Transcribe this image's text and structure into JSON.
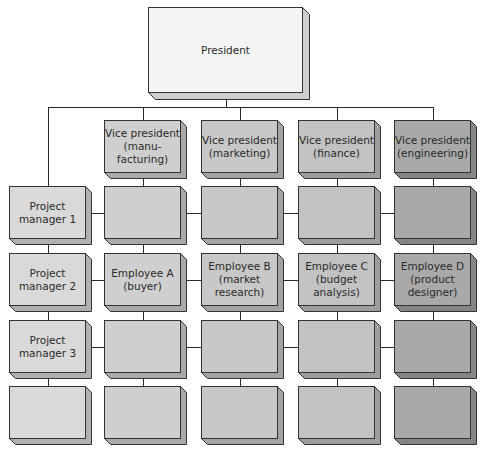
{
  "president": {
    "label": "President",
    "color": "#f4f4f4",
    "shade": "#cfcfcf"
  },
  "columns": [
    {
      "key": "pm",
      "color": "#d9d9d9",
      "shade": "#b0b0b0",
      "vp": null,
      "cells": [
        "Project\nmanager 1",
        "Project\nmanager 2",
        "Project\nmanager 3",
        ""
      ]
    },
    {
      "key": "manufacturing",
      "color": "#cfcfcf",
      "shade": "#a9a9a9",
      "vp": "Vice president\n(manu-\nfacturing)",
      "cells": [
        "",
        "Employee A\n(buyer)",
        "",
        ""
      ]
    },
    {
      "key": "marketing",
      "color": "#c8c8c8",
      "shade": "#a3a3a3",
      "vp": "Vice president\n(marketing)",
      "cells": [
        "",
        "Employee B\n(market\nresearch)",
        "",
        ""
      ]
    },
    {
      "key": "finance",
      "color": "#c2c2c2",
      "shade": "#9d9d9d",
      "vp": "Vice president\n(finance)",
      "cells": [
        "",
        "Employee C\n(budget\nanalysis)",
        "",
        ""
      ]
    },
    {
      "key": "engineering",
      "color": "#a9a9a9",
      "shade": "#858585",
      "vp": "Vice president\n(engineering)",
      "cells": [
        "",
        "Employee D\n(product\ndesigner)",
        "",
        ""
      ]
    }
  ],
  "labels": {
    "president": "President",
    "vp_manufacturing": "Vice president\n(manu-\nfacturing)",
    "vp_marketing": "Vice president\n(marketing)",
    "vp_finance": "Vice president\n(finance)",
    "vp_engineering": "Vice president\n(engineering)",
    "pm1": "Project\nmanager 1",
    "pm2": "Project\nmanager 2",
    "pm3": "Project\nmanager 3",
    "employee_a": "Employee A\n(buyer)",
    "employee_b": "Employee B\n(market\nresearch)",
    "employee_c": "Employee C\n(budget\nanalysis)",
    "employee_d": "Employee D\n(product\ndesigner)"
  }
}
